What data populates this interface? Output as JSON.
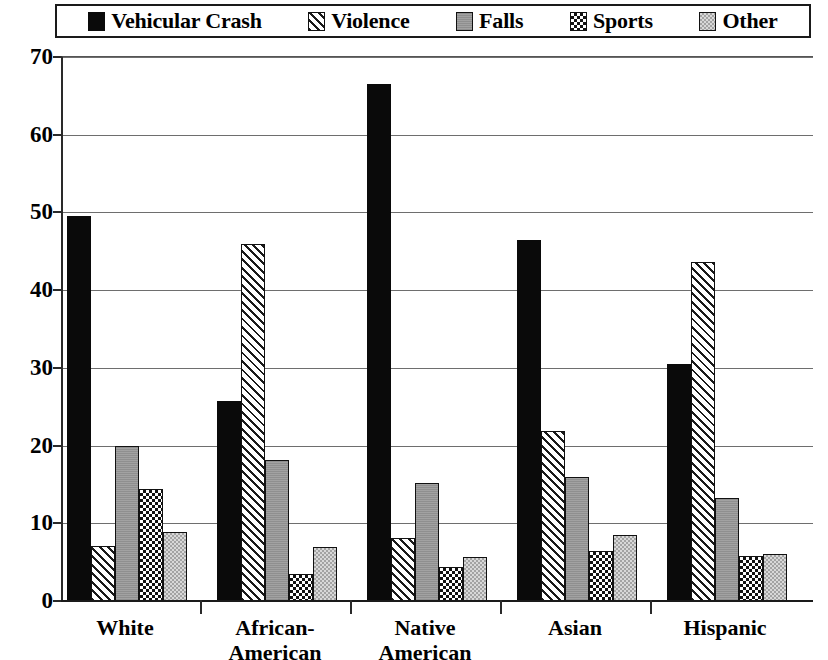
{
  "chart_data": {
    "type": "bar",
    "title": "",
    "subtitle": "",
    "xlabel": "",
    "ylabel": "",
    "ylim": [
      0,
      70
    ],
    "ytick_step": 10,
    "yticks": [
      "0",
      "10",
      "20",
      "30",
      "40",
      "50",
      "60",
      "70"
    ],
    "grid": true,
    "legend_position": "top",
    "categories": [
      "White",
      "African-\nAmerican",
      "Native\nAmerican",
      "Asian",
      "Hispanic"
    ],
    "category_labels_flat": [
      "White",
      "African-American",
      "Native American",
      "Asian",
      "Hispanic"
    ],
    "series": [
      {
        "name": "Vehicular Crash",
        "pattern": "solid-black",
        "color": "#0a0a0a",
        "values": [
          49.6,
          25.7,
          66.5,
          46.5,
          30.5
        ]
      },
      {
        "name": "Violence",
        "pattern": "diagonal-hatch",
        "color": "#1a1a1a",
        "values": [
          7.1,
          45.9,
          8.1,
          21.9,
          43.6
        ]
      },
      {
        "name": "Falls",
        "pattern": "solid-gray",
        "color": "#9a9a9a",
        "values": [
          19.9,
          18.1,
          15.2,
          16.0,
          13.2
        ]
      },
      {
        "name": "Sports",
        "pattern": "checkerboard",
        "color": "#121212",
        "values": [
          14.4,
          3.5,
          4.4,
          6.4,
          5.8
        ]
      },
      {
        "name": "Other",
        "pattern": "light-checker",
        "color": "#d8d8d8",
        "values": [
          8.9,
          6.9,
          5.6,
          8.5,
          6.1
        ]
      }
    ]
  },
  "legend": {
    "items": [
      {
        "label": "Vehicular Crash",
        "swatch": "solid-black-swatch"
      },
      {
        "label": "Violence",
        "swatch": "diagonal-hatch-swatch"
      },
      {
        "label": "Falls",
        "swatch": "solid-gray-swatch"
      },
      {
        "label": "Sports",
        "swatch": "checkerboard-swatch"
      },
      {
        "label": "Other",
        "swatch": "light-checker-swatch"
      }
    ]
  }
}
